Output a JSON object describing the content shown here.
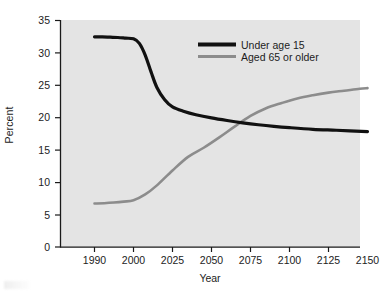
{
  "chart_data": {
    "type": "line",
    "title": "",
    "xlabel": "Year",
    "ylabel": "Percent",
    "ylim": [
      0,
      35
    ],
    "yticks": [
      0,
      5,
      10,
      15,
      20,
      25,
      30,
      35
    ],
    "ytick_labels": [
      "0",
      "5",
      "10",
      "15",
      "20",
      "25",
      "30",
      "35"
    ],
    "categories": [
      "1990",
      "2000",
      "2025",
      "2050",
      "2075",
      "2100",
      "2125",
      "2150"
    ],
    "x_axis_type": "categorical-evenly-spaced",
    "grid": false,
    "plot_background": "#e4e4e4",
    "legend_position": "upper-right-inside",
    "series": [
      {
        "name": "Under age 15",
        "color": "#111111",
        "line_width": 3.2,
        "values": [
          32.4,
          32.2,
          21.6,
          20.0,
          19.0,
          18.3,
          18.0,
          17.8
        ],
        "dense_x": [
          0,
          0.2,
          0.4,
          0.6,
          0.8,
          1.0,
          1.15,
          1.3,
          1.45,
          1.6,
          1.8,
          2.0,
          2.3,
          2.6,
          3.0,
          3.4,
          3.8,
          4.2,
          4.6,
          5.0,
          5.6,
          6.2,
          7.0
        ],
        "dense_y": [
          32.4,
          32.4,
          32.35,
          32.3,
          32.2,
          32.1,
          31.4,
          29.6,
          27.0,
          24.6,
          22.7,
          21.6,
          20.9,
          20.4,
          19.9,
          19.5,
          19.15,
          18.85,
          18.6,
          18.4,
          18.15,
          18.0,
          17.8
        ]
      },
      {
        "name": "Aged 65 or older",
        "color": "#8c8c8c",
        "line_width": 2.6,
        "values": [
          6.7,
          7.2,
          11.8,
          16.4,
          20.2,
          22.6,
          23.8,
          24.5
        ],
        "dense_x": [
          0,
          0.25,
          0.5,
          0.75,
          1.0,
          1.3,
          1.6,
          2.0,
          2.4,
          2.8,
          3.2,
          3.6,
          4.0,
          4.4,
          4.8,
          5.2,
          5.6,
          6.0,
          6.4,
          6.8,
          7.0
        ],
        "dense_y": [
          6.7,
          6.75,
          6.85,
          7.0,
          7.2,
          8.1,
          9.5,
          11.8,
          13.9,
          15.3,
          16.9,
          18.6,
          20.2,
          21.4,
          22.2,
          22.9,
          23.4,
          23.8,
          24.1,
          24.4,
          24.5
        ]
      }
    ],
    "crossover": {
      "x_category_index": 3.9,
      "value": 19.3
    },
    "legend": [
      {
        "label": "Under age 15",
        "color": "#111111",
        "swatch": "thick-black-line"
      },
      {
        "label": "Aged 65 or older",
        "color": "#8c8c8c",
        "swatch": "thick-gray-line"
      }
    ]
  },
  "axes": {
    "y_title": "Percent",
    "x_title": "Year"
  }
}
